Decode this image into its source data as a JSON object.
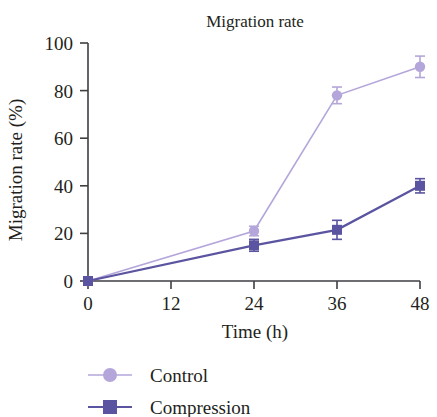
{
  "chart_data": {
    "type": "line",
    "title": "Migration rate",
    "xlabel": "Time (h)",
    "ylabel": "Migration rate (%)",
    "x": [
      0,
      24,
      36,
      48
    ],
    "xlim": [
      0,
      48
    ],
    "ylim": [
      0,
      100
    ],
    "xticks": [
      0,
      12,
      24,
      36,
      48
    ],
    "yticks": [
      0,
      20,
      40,
      60,
      80,
      100
    ],
    "xtick_labels": [
      "0",
      "12",
      "24",
      "36",
      "48"
    ],
    "ytick_labels": [
      "0",
      "20",
      "40",
      "60",
      "80",
      "100"
    ],
    "grid": false,
    "legend_position": "below",
    "series": [
      {
        "name": "Control",
        "color": "#b4a6da",
        "marker": "circle",
        "values": [
          0,
          21,
          78,
          90
        ],
        "errors": [
          0.5,
          2,
          3.5,
          4.5
        ]
      },
      {
        "name": "Compression",
        "color": "#5b54a0",
        "marker": "square",
        "values": [
          0,
          15,
          21.5,
          40
        ],
        "errors": [
          0.5,
          2.5,
          4,
          3
        ]
      }
    ]
  },
  "legend": {
    "items": [
      {
        "label": "Control",
        "color": "#b4a6da",
        "marker": "circle"
      },
      {
        "label": "Compression",
        "color": "#5b54a0",
        "marker": "square"
      }
    ]
  }
}
